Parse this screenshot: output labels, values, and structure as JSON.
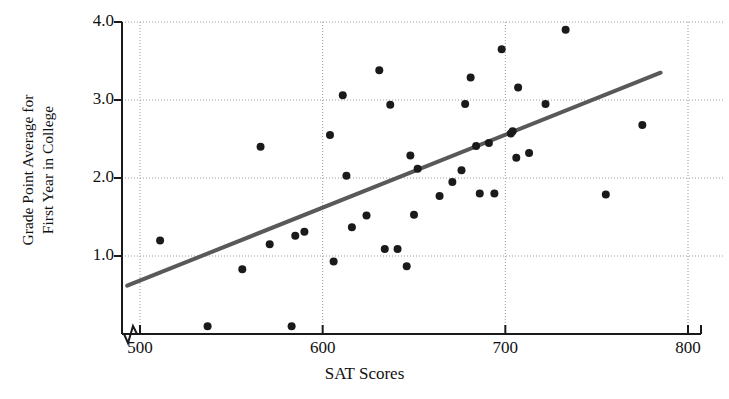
{
  "chart_data": {
    "type": "scatter",
    "title": "",
    "xlabel": "SAT Scores",
    "ylabel": "Grade Point Average for First Year in College",
    "ylabel_lines": [
      "Grade Point Average for",
      "First Year in College"
    ],
    "xlim": [
      490,
      800
    ],
    "ylim": [
      0.0,
      4.0
    ],
    "xticks": [
      500,
      600,
      700,
      800
    ],
    "xtick_labels": [
      "500",
      "600",
      "700",
      "800"
    ],
    "yticks": [
      1.0,
      2.0,
      3.0,
      4.0
    ],
    "ytick_labels": [
      "1.0",
      "2.0",
      "3.0",
      "4.0"
    ],
    "grid": true,
    "grid_style": "dotted",
    "axis_break": true,
    "axis_break_note": "zigzag break on x-axis just left of 500",
    "legend": "none",
    "marker": "filled-circle",
    "marker_color": "#1a1a1a",
    "marker_size": 7,
    "points": [
      {
        "x": 511,
        "y": 1.2
      },
      {
        "x": 537,
        "y": 0.1
      },
      {
        "x": 556,
        "y": 0.83
      },
      {
        "x": 566,
        "y": 2.4
      },
      {
        "x": 571,
        "y": 1.15
      },
      {
        "x": 583,
        "y": 0.1
      },
      {
        "x": 585,
        "y": 1.26
      },
      {
        "x": 590,
        "y": 1.31
      },
      {
        "x": 604,
        "y": 2.55
      },
      {
        "x": 606,
        "y": 0.93
      },
      {
        "x": 611,
        "y": 3.06
      },
      {
        "x": 613,
        "y": 2.03
      },
      {
        "x": 616,
        "y": 1.37
      },
      {
        "x": 624,
        "y": 1.52
      },
      {
        "x": 631,
        "y": 3.38
      },
      {
        "x": 634,
        "y": 1.09
      },
      {
        "x": 637,
        "y": 2.94
      },
      {
        "x": 641,
        "y": 1.09
      },
      {
        "x": 646,
        "y": 0.87
      },
      {
        "x": 648,
        "y": 2.29
      },
      {
        "x": 650,
        "y": 1.53
      },
      {
        "x": 652,
        "y": 2.12
      },
      {
        "x": 664,
        "y": 1.77
      },
      {
        "x": 671,
        "y": 1.95
      },
      {
        "x": 676,
        "y": 2.1
      },
      {
        "x": 678,
        "y": 2.95
      },
      {
        "x": 681,
        "y": 3.29
      },
      {
        "x": 684,
        "y": 2.41
      },
      {
        "x": 686,
        "y": 1.8
      },
      {
        "x": 691,
        "y": 2.45
      },
      {
        "x": 694,
        "y": 1.8
      },
      {
        "x": 698,
        "y": 3.65
      },
      {
        "x": 703,
        "y": 2.57
      },
      {
        "x": 704,
        "y": 2.6
      },
      {
        "x": 706,
        "y": 2.26
      },
      {
        "x": 707,
        "y": 3.16
      },
      {
        "x": 713,
        "y": 2.32
      },
      {
        "x": 722,
        "y": 2.95
      },
      {
        "x": 733,
        "y": 3.9
      },
      {
        "x": 755,
        "y": 1.79
      },
      {
        "x": 775,
        "y": 2.68
      }
    ],
    "regression_line": {
      "x_start": 493,
      "y_start": 0.62,
      "x_end": 785,
      "y_end": 3.35,
      "color": "#595959",
      "width": 4
    }
  }
}
